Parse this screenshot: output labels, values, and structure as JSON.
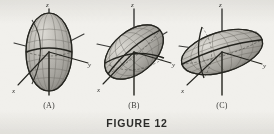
{
  "figure": {
    "caption": "FIGURE 12",
    "background_color": "#f1f0ec",
    "ink_color": "#3a3a38",
    "surface_fill": "#a9a7a2",
    "surface_highlight": "#cfcdc7"
  },
  "panels": [
    {
      "id": "A",
      "label": "(A)",
      "description": "prolate ellipsoid elongated along the z-axis",
      "axes": {
        "x": "x",
        "y": "y",
        "z": "z"
      },
      "semi_axes": {
        "a": 1.0,
        "b": 1.0,
        "c": 1.9
      },
      "tilt_degrees": 0
    },
    {
      "id": "B",
      "label": "(B)",
      "description": "ellipsoid tilted about 45 degrees in the x-z plane",
      "axes": {
        "x": "x",
        "y": "y",
        "z": "z"
      },
      "semi_axes": {
        "a": 1.75,
        "b": 1.0,
        "c": 1.0
      },
      "tilt_degrees": 40
    },
    {
      "id": "C",
      "label": "(C)",
      "description": "oblate ellipsoid flattened and nearly horizontal",
      "axes": {
        "x": "x",
        "y": "y",
        "z": "z"
      },
      "semi_axes": {
        "a": 2.1,
        "b": 1.0,
        "c": 0.85
      },
      "tilt_degrees": 18
    }
  ]
}
